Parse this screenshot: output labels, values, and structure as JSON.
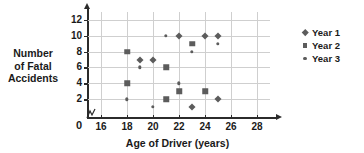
{
  "chart_data": {
    "type": "scatter",
    "title": "",
    "xlabel": "Age of Driver (years)",
    "ylabel_lines": [
      "Number",
      "of Fatal",
      "Accidents"
    ],
    "ylabel": "Number of Fatal Accidents",
    "xlim": [
      15,
      29
    ],
    "ylim": [
      0,
      13
    ],
    "x_ticks": [
      16,
      18,
      20,
      22,
      24,
      26,
      28
    ],
    "y_ticks": [
      2,
      4,
      6,
      8,
      10,
      12
    ],
    "origin_label": "0",
    "axis_break": true,
    "grid": true,
    "legend_position": "right",
    "marker_color": "#5c5c5c",
    "series": [
      {
        "name": "Year 1",
        "marker": "diamond",
        "points": [
          {
            "x": 19,
            "y": 7
          },
          {
            "x": 20,
            "y": 7
          },
          {
            "x": 22,
            "y": 10
          },
          {
            "x": 23,
            "y": 1
          },
          {
            "x": 24,
            "y": 10
          },
          {
            "x": 25,
            "y": 10
          },
          {
            "x": 25,
            "y": 2
          }
        ]
      },
      {
        "name": "Year 2",
        "marker": "square",
        "points": [
          {
            "x": 18,
            "y": 8
          },
          {
            "x": 18,
            "y": 4
          },
          {
            "x": 21,
            "y": 6
          },
          {
            "x": 21,
            "y": 2
          },
          {
            "x": 22,
            "y": 3
          },
          {
            "x": 23,
            "y": 9
          },
          {
            "x": 24,
            "y": 3
          }
        ]
      },
      {
        "name": "Year 3",
        "marker": "dot",
        "points": [
          {
            "x": 18,
            "y": 2
          },
          {
            "x": 19,
            "y": 6
          },
          {
            "x": 20,
            "y": 1
          },
          {
            "x": 21,
            "y": 10
          },
          {
            "x": 22,
            "y": 4
          },
          {
            "x": 23,
            "y": 8
          },
          {
            "x": 25,
            "y": 9
          }
        ]
      }
    ]
  }
}
